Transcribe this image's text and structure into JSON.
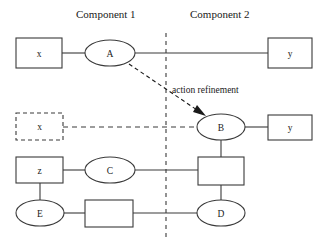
{
  "diagram": {
    "headers": [
      {
        "label": "Component 1",
        "x": 76,
        "y": 8
      },
      {
        "label": "Component 2",
        "x": 190,
        "y": 8
      }
    ],
    "divider": {
      "name": "component-divider",
      "x": 166,
      "y1": 33,
      "y2": 238,
      "style": "dashed"
    },
    "nodes": [
      {
        "id": "box-x-top",
        "label": "x",
        "shape": "rect",
        "style": "solid",
        "x": 16,
        "y": 38,
        "w": 46,
        "h": 30
      },
      {
        "id": "ellipse-a",
        "label": "A",
        "shape": "ellipse",
        "style": "solid",
        "cx": 110,
        "cy": 53,
        "rx": 25,
        "ry": 13
      },
      {
        "id": "box-y-top",
        "label": "y",
        "shape": "rect",
        "style": "solid",
        "x": 268,
        "y": 38,
        "w": 44,
        "h": 30
      },
      {
        "id": "box-x-mid",
        "label": "x",
        "shape": "rect",
        "style": "dashed",
        "x": 16,
        "y": 113,
        "w": 47,
        "h": 27
      },
      {
        "id": "ellipse-b",
        "label": "B",
        "shape": "ellipse",
        "style": "solid",
        "cx": 221,
        "cy": 127,
        "rx": 24,
        "ry": 13
      },
      {
        "id": "box-y-mid",
        "label": "y",
        "shape": "rect",
        "style": "solid",
        "x": 268,
        "y": 115,
        "w": 44,
        "h": 25
      },
      {
        "id": "box-z",
        "label": "z",
        "shape": "rect",
        "style": "solid",
        "x": 16,
        "y": 157,
        "w": 47,
        "h": 26
      },
      {
        "id": "ellipse-c",
        "label": "C",
        "shape": "ellipse",
        "style": "solid",
        "cx": 110,
        "cy": 170,
        "rx": 25,
        "ry": 13
      },
      {
        "id": "box-mid-c2",
        "label": "",
        "shape": "rect",
        "style": "solid",
        "x": 198,
        "y": 157,
        "w": 46,
        "h": 28
      },
      {
        "id": "ellipse-e",
        "label": "E",
        "shape": "ellipse",
        "style": "solid",
        "cx": 40,
        "cy": 213,
        "rx": 24,
        "ry": 13
      },
      {
        "id": "box-bottom-c1",
        "label": "",
        "shape": "rect",
        "style": "solid",
        "x": 85,
        "y": 200,
        "w": 48,
        "h": 27
      },
      {
        "id": "ellipse-d",
        "label": "D",
        "shape": "ellipse",
        "style": "solid",
        "cx": 221,
        "cy": 213,
        "rx": 24,
        "ry": 13
      }
    ],
    "edges": [
      {
        "id": "x-to-a",
        "style": "solid",
        "points": "62,53 85,53"
      },
      {
        "id": "a-to-y",
        "style": "solid",
        "points": "135,53 268,53"
      },
      {
        "id": "x-to-b",
        "style": "dashed",
        "points": "63,127 197,127"
      },
      {
        "id": "b-to-y",
        "style": "solid",
        "points": "245,127 268,127"
      },
      {
        "id": "b-to-box",
        "style": "solid",
        "points": "221,140 221,157"
      },
      {
        "id": "z-to-c",
        "style": "solid",
        "points": "63,170 85,170"
      },
      {
        "id": "c-to-box",
        "style": "solid",
        "points": "135,170 198,170"
      },
      {
        "id": "z-to-e",
        "style": "solid",
        "points": "40,183 40,200"
      },
      {
        "id": "e-to-box",
        "style": "solid",
        "points": "64,213 85,213"
      },
      {
        "id": "box-to-d",
        "style": "solid",
        "points": "133,213 197,213"
      },
      {
        "id": "box-to-dvert",
        "style": "solid",
        "points": "221,185 221,200"
      }
    ],
    "arrow": {
      "id": "action-refinement-arrow",
      "label": "action refinement",
      "label_x": 172,
      "label_y": 90,
      "path": "M 129,64 L 203,114",
      "head": "203,115 194,109 197,103 209,113"
    }
  }
}
